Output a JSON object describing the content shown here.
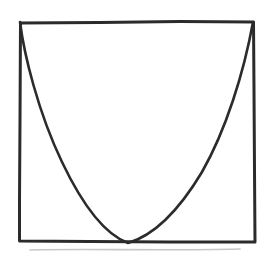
{
  "figure": {
    "kind": "hand-drawn-sketch",
    "title": "Parabola inscribed in a rectangular frame",
    "canvas": {
      "width": 274,
      "height": 259,
      "background_color": "#ffffff"
    }
  },
  "style": {
    "stroke_color": "#2b2b2b",
    "frame_stroke_width": 3.0,
    "curve_stroke_width": 2.6,
    "smudge_color": "#c9c6c9",
    "smudge_stroke_width": 1.6
  },
  "frame": {
    "name": "rectangular-frame",
    "left_x": 19,
    "right_x": 255,
    "top_y": 21,
    "bottom_y": 241,
    "width": 236,
    "height": 220,
    "corners": {
      "top_left": [
        19,
        21
      ],
      "top_right": [
        254,
        21
      ],
      "bottom_right": [
        255,
        242
      ],
      "bottom_left": [
        19,
        241
      ]
    },
    "path": "M 20.5 23 L 20 120 L 19.5 200 L 19.5 241 L 90 241.5 L 170 242 L 255 242 L 254.5 170 L 254 90 L 253.5 22 L 180 21.5 L 100 22.5 L 20.5 23 Z"
  },
  "curve": {
    "name": "parabola-curve",
    "shape": "parabola",
    "opens": "up",
    "start_point": [
      20,
      22
    ],
    "vertex": [
      128,
      243
    ],
    "end_point": [
      253,
      22
    ],
    "touches_bottom_edge": true,
    "left_branch_steeper": true,
    "path": "M 20 22 C 24 54, 38 112, 62 162 C 82 204, 104 234, 128 243 C 152 236, 178 212, 202 172 C 226 130, 244 72, 253 22",
    "chart_reference": {
      "equation_form": "y = a(x - h)^2 + k",
      "vertex_normalized": [
        0.462,
        1.0
      ],
      "endpoints_normalized": [
        [
          0.004,
          0.0
        ],
        [
          0.992,
          0.0
        ]
      ]
    }
  },
  "chart_data": {
    "type": "line",
    "title": "Parabola inscribed in a rectangular frame",
    "xlabel": "",
    "ylabel": "",
    "grid": false,
    "legend": null,
    "axis_box": true,
    "xlim": [
      0,
      1
    ],
    "ylim": [
      0,
      1
    ],
    "series": [
      {
        "name": "parabola",
        "x": [
          0.0,
          0.05,
          0.1,
          0.15,
          0.2,
          0.25,
          0.3,
          0.35,
          0.4,
          0.46,
          0.5,
          0.55,
          0.6,
          0.65,
          0.7,
          0.75,
          0.8,
          0.85,
          0.9,
          0.95,
          1.0
        ],
        "y": [
          1.0,
          0.86,
          0.73,
          0.61,
          0.5,
          0.4,
          0.29,
          0.2,
          0.1,
          0.0,
          0.01,
          0.05,
          0.11,
          0.19,
          0.28,
          0.38,
          0.5,
          0.62,
          0.75,
          0.88,
          1.0
        ]
      }
    ],
    "annotations": []
  },
  "smudge": {
    "name": "pencil-smudge",
    "present": true,
    "position_y": 250,
    "path": "M 30 250 C 90 248.5, 160 251, 240 249"
  }
}
